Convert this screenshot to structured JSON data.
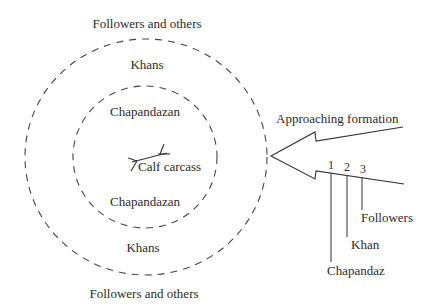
{
  "diagram": {
    "type": "formation-diagram",
    "zones": {
      "outer_top": "Followers and others",
      "khans_top": "Khans",
      "chap_top": "Chapandazan",
      "center": "Calf carcass",
      "chap_bottom": "Chapandazan",
      "khans_bottom": "Khans",
      "outer_bottom": "Followers and others"
    },
    "arrow": {
      "label": "Approaching formation",
      "positions": [
        {
          "number": "1",
          "role": "Chapandaz"
        },
        {
          "number": "2",
          "role": "Khan"
        },
        {
          "number": "3",
          "role": "Followers"
        }
      ]
    },
    "colors": {
      "ink": "#2a2a2a",
      "background": "#ffffff"
    }
  }
}
